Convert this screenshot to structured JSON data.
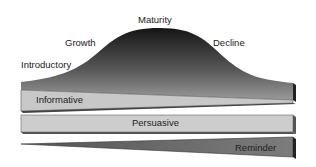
{
  "stages": {
    "introductory": "Introductory",
    "growth": "Growth",
    "maturity": "Maturity",
    "decline": "Decline"
  },
  "bands": {
    "informative": "Informative",
    "persuasive": "Persuasive",
    "reminder": "Reminder"
  },
  "colors": {
    "curve_top": "#1a1a1a",
    "curve_bottom": "#8a8a8a",
    "band_light": "#cfcfcf",
    "band_dark": "#7a7a7a",
    "edge": "#2a2a2a"
  }
}
